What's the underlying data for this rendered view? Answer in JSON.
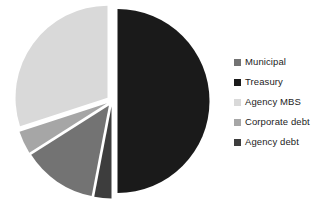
{
  "chart_data": {
    "type": "pie",
    "title": "",
    "subtitle": "",
    "xlabel": "",
    "ylabel": "",
    "grid": false,
    "legend_position": "right",
    "exploded": true,
    "start_angle_deg": 0,
    "categories": [
      "Municipal",
      "Treasury",
      "Agency MBS",
      "Corporate debt",
      "Agency debt"
    ],
    "values": [
      13,
      50,
      30,
      4,
      3
    ],
    "slices": [
      {
        "label": "Municipal",
        "value": 13,
        "color": "#737373",
        "start_pct": 53,
        "end_pct": 66,
        "explode": 0.06
      },
      {
        "label": "Treasury",
        "value": 50,
        "color": "#1a1a1a",
        "start_pct": 0,
        "end_pct": 50,
        "explode": 0.06
      },
      {
        "label": "Agency MBS",
        "value": 30,
        "color": "#d9d9d9",
        "start_pct": 70,
        "end_pct": 100,
        "explode": 0.06
      },
      {
        "label": "Corporate debt",
        "value": 4,
        "color": "#a6a6a6",
        "start_pct": 66,
        "end_pct": 70,
        "explode": 0.06
      },
      {
        "label": "Agency debt",
        "value": 3,
        "color": "#3d3d3d",
        "start_pct": 50,
        "end_pct": 53,
        "explode": 0.06
      }
    ]
  },
  "legend": {
    "items": [
      {
        "label": "Municipal",
        "color": "#737373"
      },
      {
        "label": "Treasury",
        "color": "#1a1a1a"
      },
      {
        "label": "Agency MBS",
        "color": "#d9d9d9"
      },
      {
        "label": "Corporate debt",
        "color": "#a6a6a6"
      },
      {
        "label": "Agency debt",
        "color": "#3d3d3d"
      }
    ]
  }
}
